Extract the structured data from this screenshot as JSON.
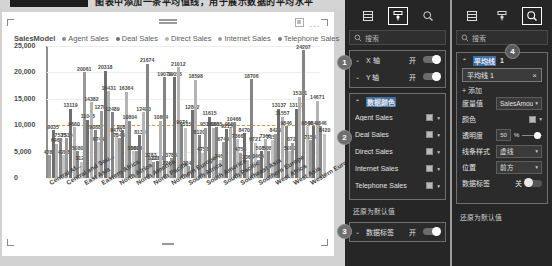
{
  "topbar": {
    "redacted_block": "",
    "caption": "图表中添加一条平均值线，用于展示数据的平均水平"
  },
  "report": {
    "header_icons": {
      "focus": "focus-mode-icon",
      "more": "..."
    },
    "legend": {
      "title": "SalesModel",
      "items": [
        {
          "label": "Agent Sales",
          "color": "#8a8a8a"
        },
        {
          "label": "Deal Sales",
          "color": "#6f6f6f"
        },
        {
          "label": "Direct Sales",
          "color": "#b4b4b4"
        },
        {
          "label": "Internet Sales",
          "color": "#9c9c9c"
        },
        {
          "label": "Telephone Sales",
          "color": "#7d7d7d"
        }
      ]
    }
  },
  "chart_data": {
    "type": "bar",
    "title": "SalesModel",
    "xlabel": "",
    "ylabel": "",
    "ylim": [
      0,
      25000
    ],
    "yticks": [
      "0",
      "5,000",
      "10,000",
      "15,000",
      "20,000",
      "25,000"
    ],
    "grid": true,
    "legend_position": "top",
    "average_line": 10000,
    "categories": [
      "Central Af...",
      "Central and Sou...",
      "East Asia",
      "Eastern Africa",
      "North Africa",
      "North America",
      "North Pacific",
      "Northern Europe",
      "South Africa",
      "South America",
      "South Pacific",
      "Southeast Asia",
      "Southern Europe",
      "West Africa",
      "West Asia",
      "Western Europe"
    ],
    "series": [
      {
        "name": "Agent Sales",
        "values": [
          4288,
          7535,
          20061,
          12783,
          7546,
          5094,
          3127,
          3783,
          2248,
          9515,
          6749,
          4756,
          3468,
          8420,
          6721,
          7154
        ]
      },
      {
        "name": "Deal Sales",
        "values": [
          9035,
          13119,
          11048,
          20318,
          9088,
          8133,
          3193,
          19056,
          12862,
          11615,
          9215,
          8470,
          5080,
          13137,
          13131,
          9846
        ]
      },
      {
        "name": "Direct Sales",
        "values": [
          6462,
          9660,
          14382,
          16431,
          16364,
          12480,
          10804,
          21012,
          18598,
          9530,
          9563,
          3368,
          7366,
          11557,
          15381,
          14671
        ]
      },
      {
        "name": "Internet Sales",
        "values": [
          7535,
          5080,
          9088,
          12489,
          10804,
          21674,
          19079,
          9974,
          8120,
          9655,
          10466,
          18706,
          5080,
          9846,
          24207,
          9846
        ]
      },
      {
        "name": "Telephone Sales",
        "values": [
          4288,
          3127,
          6749,
          8470,
          5080,
          3783,
          2248,
          9515,
          4756,
          3468,
          7366,
          6721,
          7154,
          5080,
          9846,
          8420
        ]
      }
    ],
    "point_labels": [
      "9035",
      "7535",
      "4288",
      "6462",
      "13119",
      "11048",
      "20061",
      "12783",
      "7546",
      "5094",
      "3127",
      "9088",
      "8133",
      "3193",
      "3783",
      "2248",
      "9515",
      "19056",
      "12862",
      "11615",
      "9215",
      "8470",
      "5080",
      "6749",
      "4756",
      "3468",
      "14382",
      "16431",
      "18598",
      "21012",
      "12489",
      "9530",
      "9563",
      "16364",
      "10804",
      "8420",
      "7366",
      "21674",
      "19079",
      "13137",
      "11557",
      "9974",
      "8120",
      "9655",
      "10466",
      "18706",
      "15381",
      "13131",
      "6721",
      "7154",
      "5080",
      "24207",
      "14671",
      "9846"
    ]
  },
  "panelA": {
    "tabs": [
      {
        "name": "fields-icon",
        "selected": false
      },
      {
        "name": "format-paint-icon",
        "selected": true
      },
      {
        "name": "analytics-magnifier-icon",
        "selected": false
      }
    ],
    "search": {
      "placeholder": "搜索",
      "icon": "search-icon"
    },
    "axes": [
      {
        "label": "X 轴",
        "state": "开",
        "on": true
      },
      {
        "label": "Y 轴",
        "state": "开",
        "on": true
      }
    ],
    "colors_section": {
      "label": "数据颜色",
      "collapsed": false
    },
    "color_items": [
      {
        "label": "Agent Sales",
        "color": "#b9b9b9"
      },
      {
        "label": "Deal Sales",
        "color": "#b9b9b9"
      },
      {
        "label": "Direct Sales",
        "color": "#b9b9b9"
      },
      {
        "label": "Internet Sales",
        "color": "#b9b9b9"
      },
      {
        "label": "Telephone Sales",
        "color": "#b9b9b9"
      }
    ],
    "reset_link": "还原为默认值",
    "data_labels": {
      "label": "数据标签",
      "state": "开",
      "on": true
    },
    "badges": [
      "1",
      "2",
      "3"
    ]
  },
  "panelB": {
    "tabs": [
      {
        "name": "fields-icon",
        "selected": false
      },
      {
        "name": "format-paint-icon",
        "selected": false
      },
      {
        "name": "analytics-magnifier-icon",
        "selected": true
      }
    ],
    "search": {
      "placeholder": "搜索",
      "icon": "search-icon"
    },
    "badge": "4",
    "section": {
      "label": "平均线",
      "count": "1"
    },
    "item_chip": {
      "label": "平均线 1",
      "close": "×"
    },
    "add_link": "+ 添加",
    "fields": [
      {
        "key": "度量值",
        "value": "SalesAmou...",
        "type": "select"
      },
      {
        "key": "颜色",
        "value": "",
        "type": "color",
        "color": "#b9b9b9"
      },
      {
        "key": "透明度",
        "value": "50",
        "unit": "%",
        "type": "slider"
      },
      {
        "key": "线条样式",
        "value": "虚线",
        "type": "select"
      },
      {
        "key": "位置",
        "value": "前方",
        "type": "select"
      },
      {
        "key": "数据标签",
        "value": "关",
        "type": "toggle",
        "on": false
      }
    ],
    "reset_link": "还原为默认值"
  }
}
